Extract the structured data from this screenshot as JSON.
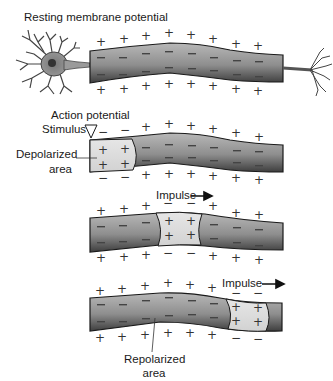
{
  "title": "Resting membrane potential",
  "labels": {
    "resting": "Resting membrane potential",
    "action": "Action potential",
    "stimulus": "Stimulus",
    "depolarized_line1": "Depolarized",
    "depolarized_line2": "area",
    "impulse1": "Impulse",
    "impulse2": "Impulse",
    "repolarized_line1": "Repolarized",
    "repolarized_line2": "area"
  },
  "icons": {
    "arrow": "right-arrow",
    "stimulus": "down-triangle"
  },
  "colors": {
    "axon_dark": "#4a4a4a",
    "axon_mid": "#8c8c8c",
    "axon_light": "#b5b5b5",
    "depolarized_fill": "#dedede",
    "outline": "#1a1a1a"
  },
  "panels": [
    {
      "name": "resting",
      "state": "all polarized: + outside, - inside"
    },
    {
      "name": "action-potential",
      "state": "left end depolarized: - outside, + inside"
    },
    {
      "name": "propagation",
      "state": "middle depolarized"
    },
    {
      "name": "repolarization",
      "state": "right end depolarized, left repolarized"
    }
  ]
}
